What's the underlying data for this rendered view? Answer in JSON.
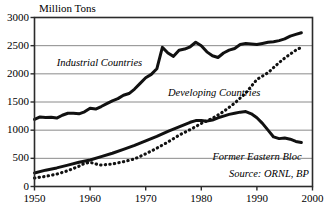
{
  "chart_data": {
    "type": "line",
    "title": "",
    "ylabel": "Million Tons",
    "xlabel": "",
    "xlim": [
      1950,
      2000
    ],
    "ylim": [
      0,
      3000
    ],
    "grid": true,
    "legend_position": "inline-annotations",
    "x_ticks": [
      "1950",
      "1960",
      "1970",
      "1980",
      "1990",
      "2000"
    ],
    "y_ticks": [
      "0",
      "500",
      "1000",
      "1500",
      "2000",
      "2500",
      "3000"
    ],
    "annotations": [
      {
        "text": "Industrial Countries",
        "x": 1954,
        "y": 2180
      },
      {
        "text": "Developing Countries",
        "x": 1974,
        "y": 1640
      },
      {
        "text": "Former Eastern Bloc",
        "x": 1982,
        "y": 500
      },
      {
        "text": "Source: ORNL, BP",
        "x": 1985,
        "y": 200
      }
    ],
    "series": [
      {
        "name": "Industrial Countries",
        "style": "solid",
        "color": "#111111",
        "x": [
          1950,
          1951,
          1952,
          1953,
          1954,
          1955,
          1956,
          1957,
          1958,
          1959,
          1960,
          1961,
          1962,
          1963,
          1964,
          1965,
          1966,
          1967,
          1968,
          1969,
          1970,
          1971,
          1972,
          1973,
          1974,
          1975,
          1976,
          1977,
          1978,
          1979,
          1980,
          1981,
          1982,
          1983,
          1984,
          1985,
          1986,
          1987,
          1988,
          1989,
          1990,
          1991,
          1992,
          1993,
          1994,
          1995,
          1996,
          1997,
          1998
        ],
        "y": [
          1190,
          1235,
          1225,
          1230,
          1215,
          1265,
          1300,
          1300,
          1290,
          1325,
          1390,
          1375,
          1420,
          1470,
          1520,
          1560,
          1620,
          1650,
          1730,
          1830,
          1930,
          1990,
          2090,
          2470,
          2370,
          2310,
          2420,
          2440,
          2480,
          2560,
          2500,
          2390,
          2320,
          2290,
          2370,
          2420,
          2450,
          2520,
          2540,
          2530,
          2520,
          2540,
          2560,
          2570,
          2590,
          2620,
          2670,
          2700,
          2730
        ]
      },
      {
        "name": "Former Eastern Bloc",
        "style": "solid",
        "color": "#111111",
        "x": [
          1950,
          1952,
          1954,
          1956,
          1958,
          1960,
          1962,
          1964,
          1966,
          1968,
          1970,
          1972,
          1974,
          1976,
          1978,
          1979,
          1980,
          1981,
          1982,
          1983,
          1984,
          1985,
          1986,
          1987,
          1988,
          1989,
          1990,
          1991,
          1992,
          1993,
          1994,
          1995,
          1996,
          1997,
          1998
        ],
        "y": [
          240,
          290,
          330,
          380,
          430,
          470,
          530,
          590,
          660,
          730,
          810,
          890,
          980,
          1060,
          1140,
          1170,
          1170,
          1160,
          1180,
          1220,
          1250,
          1280,
          1300,
          1320,
          1330,
          1290,
          1220,
          1120,
          1000,
          880,
          850,
          860,
          840,
          800,
          780
        ]
      },
      {
        "name": "Developing Countries",
        "style": "dotted",
        "color": "#111111",
        "x": [
          1950,
          1952,
          1954,
          1956,
          1958,
          1959,
          1960,
          1961,
          1962,
          1963,
          1964,
          1966,
          1968,
          1970,
          1972,
          1974,
          1976,
          1978,
          1980,
          1982,
          1984,
          1986,
          1988,
          1990,
          1991,
          1992,
          1993,
          1994,
          1995,
          1996,
          1997,
          1998
        ],
        "y": [
          150,
          180,
          220,
          280,
          360,
          410,
          430,
          400,
          380,
          390,
          400,
          440,
          490,
          580,
          680,
          790,
          910,
          1010,
          1120,
          1210,
          1330,
          1480,
          1660,
          1900,
          1960,
          2020,
          2110,
          2200,
          2280,
          2350,
          2420,
          2470
        ]
      }
    ]
  }
}
